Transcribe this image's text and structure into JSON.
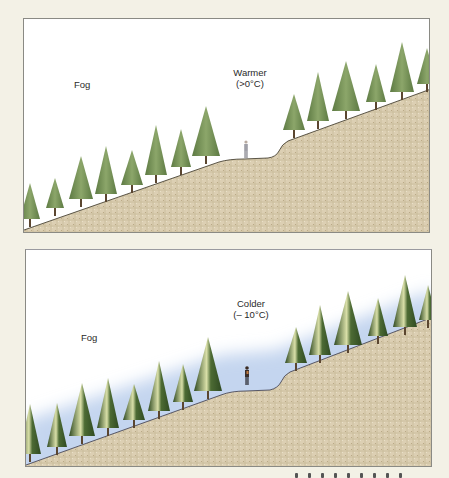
{
  "figure": {
    "panels": [
      {
        "id": "warmer",
        "fog_label": "Fog",
        "temp_label_line1": "Warmer",
        "temp_label_line2": "(>0°C)",
        "sky_color": "#ffffff",
        "fog_color": "#ffffff",
        "tree_color": "#6f8a52",
        "tree_highlight": "#9bb078",
        "ground_color": "#d9ccb0"
      },
      {
        "id": "colder",
        "fog_label": "Fog",
        "temp_label_line1": "Colder",
        "temp_label_line2": "(– 10°C)",
        "sky_color": "#ffffff",
        "fog_color": "#c3d4ee",
        "tree_color": "#3f5e2c",
        "tree_highlight": "#e8ecc0",
        "ground_color": "#d9ccb0"
      }
    ],
    "trees_per_panel": 14,
    "figures": [
      "hiker-top",
      "hiker-bottom"
    ]
  }
}
